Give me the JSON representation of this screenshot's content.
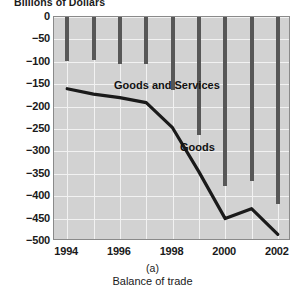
{
  "figure": {
    "panel_letter": "(a)",
    "caption": "Balance of trade"
  },
  "axes": {
    "y_title": "Billions of Dollars",
    "y_ticks": [
      "0",
      "−50",
      "−100",
      "−150",
      "−200",
      "−250",
      "−300",
      "−350",
      "−400",
      "−450",
      "−500"
    ],
    "x_ticks": [
      "1994",
      "1996",
      "1998",
      "2000",
      "2002"
    ]
  },
  "annotations": {
    "goods_and_services": "Goods and Services",
    "goods": "Goods"
  },
  "colors": {
    "plot_background": "#d2d2d2",
    "grid": "#f2f2f2",
    "bar": "#575757",
    "line": "#1a1a1a",
    "frame": "#8a8a8a"
  },
  "chart_data": {
    "type": "bar",
    "title": "Balance of trade",
    "subtitle": "(a)",
    "xlabel": "",
    "ylabel": "Billions of Dollars",
    "categories": [
      "1994",
      "1995",
      "1996",
      "1997",
      "1998",
      "1999",
      "2000",
      "2001",
      "2002"
    ],
    "x": [
      1994,
      1995,
      1996,
      1997,
      1998,
      1999,
      2000,
      2001,
      2002
    ],
    "ylim": [
      -500,
      0
    ],
    "xlim": [
      1993.5,
      2002.5
    ],
    "grid": true,
    "legend": "none",
    "series": [
      {
        "name": "Goods and Services",
        "type": "bar",
        "values": [
          -98,
          -96,
          -104,
          -105,
          -164,
          -263,
          -378,
          -365,
          -418
        ]
      },
      {
        "name": "Goods",
        "type": "line",
        "values": [
          -160,
          -172,
          -180,
          -191,
          -247,
          -345,
          -450,
          -428,
          -485
        ]
      }
    ]
  }
}
